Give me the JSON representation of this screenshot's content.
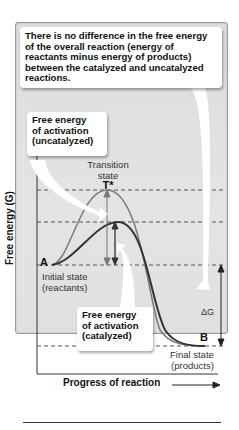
{
  "callouts": {
    "overall": "There is no difference in the free energy of the overall reaction (energy of reactants minus energy of products) between the catalyzed and uncatalyzed reactions.",
    "uncatalyzed": "Free energy\nof activation\n(uncatalyzed)",
    "catalyzed": "Free energy\nof activation\n(catalyzed)"
  },
  "labels": {
    "transition_state": "Transition\nstate",
    "t_star": "T*",
    "point_a": "A",
    "initial_state": "Initial state\n(reactants)",
    "point_b": "B",
    "final_state": "Final state\n(products)",
    "delta_g": "ΔG"
  },
  "axes": {
    "y_label": "Free energy (G)",
    "x_label": "Progress of reaction"
  },
  "colors": {
    "panel_bg": "#e0e0e0",
    "uncatalyzed_curve": "#7a7a7a",
    "catalyzed_curve": "#333333",
    "text": "#111111"
  }
}
